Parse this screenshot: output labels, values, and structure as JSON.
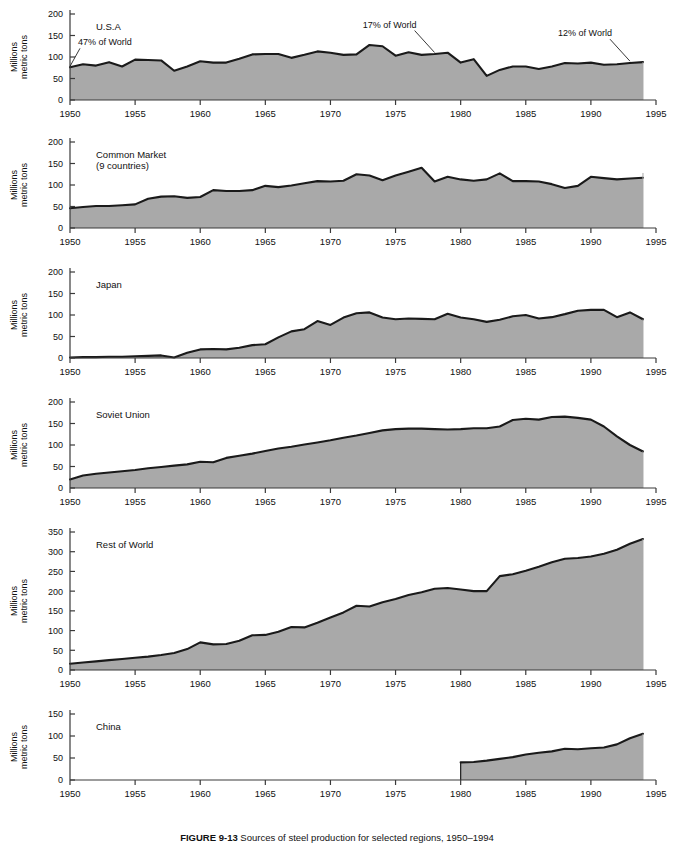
{
  "figure": {
    "caption_label": "FIGURE 9-13",
    "caption_text": "Sources of steel production for selected regions, 1950–1994",
    "axis_y_title": "Millions\nmetric tons",
    "x_ticks": [
      1950,
      1955,
      1960,
      1965,
      1970,
      1975,
      1980,
      1985,
      1990,
      1995
    ],
    "x_range": [
      1950,
      1995
    ],
    "fill_color": "#a9a9a9",
    "line_color": "#1a1a1a",
    "axis_color": "#3a3a3a",
    "background": "#ffffff"
  },
  "chart_data": [
    {
      "type": "area",
      "title": "U.S.A",
      "panel_index": 0,
      "xlabel": "",
      "ylabel": "Millions metric tons",
      "ylim": [
        0,
        200
      ],
      "y_ticks": [
        0,
        50,
        100,
        150,
        200
      ],
      "xlim": [
        1950,
        1995
      ],
      "grid": false,
      "legend": "none",
      "annotations": [
        {
          "text": "47% of World",
          "year": 1950,
          "value": 76
        },
        {
          "text": "17% of World",
          "year": 1978,
          "value": 108
        },
        {
          "text": "12% of World",
          "year": 1993,
          "value": 88
        }
      ],
      "x": [
        1950,
        1951,
        1952,
        1953,
        1954,
        1955,
        1956,
        1957,
        1958,
        1959,
        1960,
        1961,
        1962,
        1963,
        1964,
        1965,
        1966,
        1967,
        1968,
        1969,
        1970,
        1971,
        1972,
        1973,
        1974,
        1975,
        1976,
        1977,
        1978,
        1979,
        1980,
        1981,
        1982,
        1983,
        1984,
        1985,
        1986,
        1987,
        1988,
        1989,
        1990,
        1991,
        1992,
        1993,
        1994
      ],
      "values": [
        76,
        83,
        80,
        88,
        78,
        94,
        93,
        92,
        68,
        78,
        90,
        87,
        87,
        96,
        106,
        107,
        107,
        98,
        105,
        113,
        110,
        105,
        106,
        128,
        125,
        103,
        111,
        105,
        107,
        110,
        87,
        95,
        56,
        70,
        78,
        78,
        72,
        78,
        86,
        85,
        87,
        82,
        83,
        86,
        88
      ]
    },
    {
      "type": "area",
      "title": "Common Market",
      "subtitle": "(9 countries)",
      "panel_index": 1,
      "xlabel": "",
      "ylabel": "Millions metric tons",
      "ylim": [
        0,
        200
      ],
      "y_ticks": [
        0,
        50,
        100,
        150,
        200
      ],
      "xlim": [
        1950,
        1995
      ],
      "grid": false,
      "legend": "none",
      "annotations": [],
      "x": [
        1950,
        1951,
        1952,
        1953,
        1954,
        1955,
        1956,
        1957,
        1958,
        1959,
        1960,
        1961,
        1962,
        1963,
        1964,
        1965,
        1966,
        1967,
        1968,
        1969,
        1970,
        1971,
        1972,
        1973,
        1974,
        1975,
        1976,
        1977,
        1978,
        1979,
        1980,
        1981,
        1982,
        1983,
        1984,
        1985,
        1986,
        1987,
        1988,
        1989,
        1990,
        1991,
        1992,
        1993,
        1994
      ],
      "values": [
        46,
        49,
        51,
        51,
        53,
        55,
        68,
        73,
        74,
        70,
        72,
        88,
        86,
        86,
        88,
        98,
        95,
        99,
        104,
        109,
        108,
        110,
        125,
        122,
        111,
        122,
        131,
        140,
        108,
        119,
        113,
        110,
        113,
        127,
        109,
        109,
        108,
        102,
        93,
        98,
        119,
        116,
        113,
        115,
        117,
        121,
        132,
        124,
        125,
        127,
        128
      ]
    },
    {
      "type": "area",
      "title": "Japan",
      "panel_index": 2,
      "xlabel": "",
      "ylabel": "Millions metric tons",
      "ylim": [
        0,
        200
      ],
      "y_ticks": [
        0,
        50,
        100,
        150,
        200
      ],
      "xlim": [
        1950,
        1995
      ],
      "grid": false,
      "legend": "none",
      "annotations": [],
      "x": [
        1950,
        1951,
        1952,
        1953,
        1954,
        1955,
        1956,
        1957,
        1958,
        1959,
        1960,
        1961,
        1962,
        1963,
        1964,
        1965,
        1966,
        1967,
        1968,
        1969,
        1970,
        1971,
        1972,
        1973,
        1974,
        1975,
        1976,
        1977,
        1978,
        1979,
        1980,
        1981,
        1982,
        1983,
        1984,
        1985,
        1986,
        1987,
        1988,
        1989,
        1990,
        1991,
        1992,
        1993,
        1994
      ],
      "values": [
        1,
        2,
        2,
        3,
        3,
        4,
        5,
        6,
        1,
        12,
        20,
        21,
        20,
        24,
        30,
        32,
        48,
        62,
        67,
        86,
        77,
        94,
        104,
        106,
        94,
        90,
        92,
        91,
        90,
        103,
        94,
        90,
        84,
        89,
        97,
        100,
        92,
        95,
        102,
        110,
        112,
        112,
        95,
        106,
        90
      ]
    },
    {
      "type": "area",
      "title": "Soviet Union",
      "panel_index": 3,
      "xlabel": "",
      "ylabel": "Millions metric tons",
      "ylim": [
        0,
        200
      ],
      "y_ticks": [
        0,
        50,
        100,
        150,
        200
      ],
      "xlim": [
        1950,
        1995
      ],
      "grid": false,
      "legend": "none",
      "annotations": [],
      "x": [
        1950,
        1951,
        1952,
        1953,
        1954,
        1955,
        1956,
        1957,
        1958,
        1959,
        1960,
        1961,
        1962,
        1963,
        1964,
        1965,
        1966,
        1967,
        1968,
        1969,
        1970,
        1971,
        1972,
        1973,
        1974,
        1975,
        1976,
        1977,
        1978,
        1979,
        1980,
        1981,
        1982,
        1983,
        1984,
        1985,
        1986,
        1987,
        1988,
        1989,
        1990,
        1991,
        1992,
        1993,
        1994
      ],
      "values": [
        20,
        29,
        33,
        36,
        39,
        42,
        46,
        49,
        52,
        55,
        61,
        60,
        70,
        75,
        80,
        86,
        92,
        96,
        101,
        106,
        111,
        117,
        122,
        128,
        134,
        137,
        138,
        138,
        137,
        136,
        137,
        139,
        139,
        143,
        158,
        161,
        159,
        165,
        166,
        163,
        159,
        143,
        120,
        100,
        85
      ]
    },
    {
      "type": "area",
      "title": "Rest of World",
      "panel_index": 4,
      "xlabel": "",
      "ylabel": "Millions metric tons",
      "ylim": [
        0,
        350
      ],
      "y_ticks": [
        0,
        50,
        100,
        150,
        200,
        250,
        300,
        350
      ],
      "xlim": [
        1950,
        1995
      ],
      "grid": false,
      "legend": "none",
      "annotations": [],
      "x": [
        1950,
        1951,
        1952,
        1953,
        1954,
        1955,
        1956,
        1957,
        1958,
        1959,
        1960,
        1961,
        1962,
        1963,
        1964,
        1965,
        1966,
        1967,
        1968,
        1969,
        1970,
        1971,
        1972,
        1973,
        1974,
        1975,
        1976,
        1977,
        1978,
        1979,
        1980,
        1981,
        1982,
        1983,
        1984,
        1985,
        1986,
        1987,
        1988,
        1989,
        1990,
        1991,
        1992,
        1993,
        1994
      ],
      "values": [
        16,
        19,
        22,
        25,
        28,
        31,
        34,
        38,
        43,
        53,
        70,
        65,
        66,
        74,
        88,
        89,
        97,
        109,
        108,
        120,
        133,
        146,
        163,
        161,
        172,
        180,
        190,
        197,
        206,
        208,
        204,
        200,
        200,
        238,
        243,
        252,
        262,
        273,
        282,
        284,
        288,
        295,
        305,
        320,
        332
      ]
    },
    {
      "type": "area",
      "title": "China",
      "panel_index": 5,
      "xlabel": "",
      "ylabel": "Millions metric tons",
      "ylim": [
        0,
        150
      ],
      "y_ticks": [
        0,
        50,
        100,
        150
      ],
      "xlim": [
        1950,
        1995
      ],
      "grid": false,
      "legend": "none",
      "annotations": [],
      "x": [
        1980,
        1981,
        1982,
        1983,
        1984,
        1985,
        1986,
        1987,
        1988,
        1989,
        1990,
        1991,
        1992,
        1993,
        1994
      ],
      "values": [
        40,
        41,
        44,
        48,
        52,
        58,
        62,
        65,
        71,
        70,
        72,
        74,
        81,
        95,
        105
      ]
    }
  ]
}
